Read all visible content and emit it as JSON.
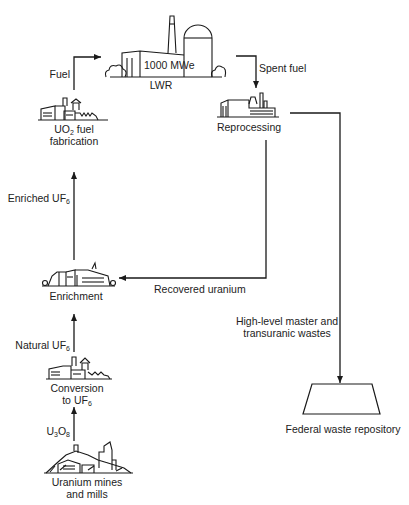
{
  "diagram": {
    "type": "nuclear fuel cycle flow diagram",
    "nodes": {
      "lwr": {
        "label": "LWR",
        "rating": "1000 MWe"
      },
      "fuel_fab": {
        "label_line1_pre": "UO",
        "label_line1_sub": "2",
        "label_line1_post": " fuel",
        "label_line2": "fabrication"
      },
      "reprocessing": {
        "label": "Reprocessing"
      },
      "enrichment": {
        "label": "Enrichment"
      },
      "conversion": {
        "label_line1": "Conversion",
        "label_line2_pre": "to UF",
        "label_line2_sub": "6"
      },
      "mines": {
        "label_line1": "Uranium mines",
        "label_line2": "and mills"
      },
      "repository": {
        "label": "Federal waste repository"
      }
    },
    "flows": {
      "fuel": {
        "label": "Fuel"
      },
      "spent_fuel": {
        "label": "Spent fuel"
      },
      "enriched": {
        "label_pre": "Enriched UF",
        "label_sub": "6"
      },
      "recovered": {
        "label": "Recovered uranium"
      },
      "natural": {
        "label_pre": "Natural UF",
        "label_sub": "6"
      },
      "u3o8": {
        "label_a": "U",
        "label_sub1": "3",
        "label_b": "O",
        "label_sub2": "8"
      },
      "wastes": {
        "label_line1": "High-level master and",
        "label_line2": "transuranic wastes"
      }
    },
    "colors": {
      "line": "#1a1a1a",
      "background": "#ffffff"
    }
  }
}
